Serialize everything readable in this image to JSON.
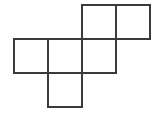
{
  "figure": {
    "background_color": "#ffffff",
    "stroke_color": "#3a3a3a",
    "stroke_width": 2,
    "cell_size": 34,
    "canvas": {
      "width": 159,
      "height": 116
    },
    "origin": {
      "x": 14,
      "y": 5
    },
    "squares": [
      {
        "name": "square-top-left",
        "row": 0,
        "col": 2,
        "x": 82,
        "y": 5,
        "w": 34,
        "h": 34
      },
      {
        "name": "square-top-right",
        "row": 0,
        "col": 3,
        "x": 116,
        "y": 5,
        "w": 34,
        "h": 34
      },
      {
        "name": "square-middle-left",
        "row": 1,
        "col": 0,
        "x": 14,
        "y": 39,
        "w": 34,
        "h": 34
      },
      {
        "name": "square-middle-center",
        "row": 1,
        "col": 1,
        "x": 48,
        "y": 39,
        "w": 34,
        "h": 34
      },
      {
        "name": "square-middle-right",
        "row": 1,
        "col": 2,
        "x": 82,
        "y": 39,
        "w": 34,
        "h": 34
      },
      {
        "name": "square-bottom",
        "row": 2,
        "col": 1,
        "x": 48,
        "y": 73,
        "w": 34,
        "h": 34
      }
    ],
    "counts": {
      "total_squares": 6,
      "rows": 3,
      "top_row_squares": 2,
      "middle_row_squares": 3,
      "bottom_row_squares": 1
    }
  }
}
